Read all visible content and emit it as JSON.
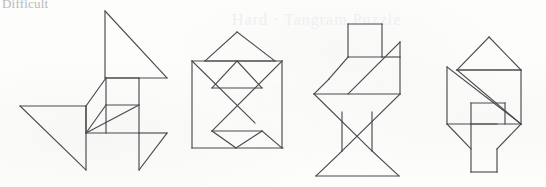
{
  "page": {
    "heading": "Difficult",
    "ghost_watermark": "Hard · Tangram Puzzle",
    "background_color": "#fdfdfc",
    "stroke_color": "#4a4a4e",
    "stroke_width": 1.15,
    "width": 546,
    "height": 187
  },
  "figures": [
    {
      "id": "figure-1",
      "name": "tangram-figure-1",
      "label": "Tangram silhouette 1 — pinwheel / bird shape",
      "piece_count": 7,
      "pieces": [
        {
          "name": "large-triangle-top",
          "type": "triangle",
          "points": "105,11 105,78 167,78"
        },
        {
          "name": "large-triangle-left",
          "type": "triangle",
          "points": "20,106 86,106 86,170"
        },
        {
          "name": "square-upper",
          "type": "square",
          "points": "106,78 139,78 139,105 106,105"
        },
        {
          "name": "parallelogram-middle",
          "type": "parallelogram",
          "points": "86,106 106,78 106,105 86,133"
        },
        {
          "name": "medium-triangle-lower-left",
          "type": "triangle",
          "points": "86,106 106,105 86,133"
        },
        {
          "name": "small-triangle-lower-center",
          "type": "triangle",
          "points": "86,133 139,133 139,105"
        },
        {
          "name": "small-triangle-right",
          "type": "triangle",
          "points": "139,105 139,133 167,133"
        },
        {
          "name": "small-triangle-bottom-right",
          "type": "triangle",
          "points": "139,133 139,170 167,133"
        }
      ],
      "segments": [
        "105,11 105,78",
        "105,11 167,78",
        "105,78 167,78",
        "20,106 86,106",
        "20,106 86,170",
        "86,106 86,170",
        "106,78 106,133",
        "139,78 139,170",
        "106,78 139,78",
        "106,105 139,105",
        "86,106 106,78",
        "86,133 139,133",
        "86,133 139,105",
        "139,133 167,133",
        "139,170 167,133",
        "86,106 86,133",
        "106,105 86,133"
      ]
    },
    {
      "id": "figure-2",
      "name": "tangram-figure-2",
      "label": "Tangram silhouette 2 — house / square with hat",
      "piece_count": 7,
      "segments": [
        "237,32 205,61",
        "237,32 275,61",
        "205,61 275,61",
        "192,61 282,61",
        "192,61 192,148",
        "282,61 282,148",
        "192,148 283,148",
        "192,61 255,123",
        "282,61 212,131",
        "237,61 212,88",
        "237,61 262,88",
        "212,88 262,88",
        "212,131 262,131",
        "212,131 236,148",
        "262,131 282,148",
        "236,148 262,131"
      ]
    },
    {
      "id": "figure-3",
      "name": "tangram-figure-3",
      "label": "Tangram silhouette 3 — standing figure / hourglass",
      "piece_count": 7,
      "segments": [
        "348,24 382,24",
        "348,24 348,57",
        "382,24 382,57",
        "348,57 382,57",
        "348,57 329,79",
        "329,79 314,94",
        "314,94 400,94",
        "400,94 400,42",
        "400,42 348,94",
        "382,57 400,57",
        "314,94 372,151",
        "400,94 342,151",
        "342,112 342,151",
        "372,112 372,151",
        "342,151 316,176",
        "372,151 399,176",
        "316,176 399,176"
      ]
    },
    {
      "id": "figure-4",
      "name": "tangram-figure-4",
      "label": "Tangram silhouette 4 — zig-zag / S shape",
      "piece_count": 7,
      "segments": [
        "489,37 457,70",
        "489,37 521,70",
        "457,70 521,70",
        "457,70 521,70",
        "457,70 521,124",
        "521,70 521,124",
        "447,67 447,124",
        "447,67 521,124",
        "471,124 521,124",
        "471,103 505,103",
        "471,103 471,124",
        "505,103 505,124",
        "447,124 471,149",
        "471,124 471,172",
        "521,124 497,149",
        "497,149 497,172",
        "471,172 497,172",
        "447,124 497,124"
      ]
    }
  ]
}
